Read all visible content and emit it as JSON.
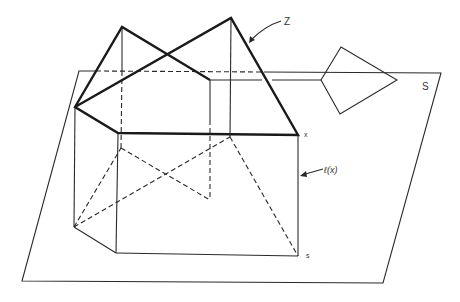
{
  "diagram": {
    "type": "geometric-3d-figure",
    "labels": {
      "Z": "Z",
      "S": "S",
      "x": "x",
      "s": "s",
      "ell": "ℓ(x)"
    },
    "elements": [
      {
        "id": "plane-S",
        "desc": "Parallelogram plane S, partially hidden behind figure"
      },
      {
        "id": "set-Z",
        "desc": "Bold polygonal set Z with two triangular peaks above box"
      },
      {
        "id": "prism-box",
        "desc": "Box/prism under Z with hidden dashed edges"
      },
      {
        "id": "kite",
        "desc": "Kite-shaped quadrilateral on the right, attached by horizontal line"
      },
      {
        "id": "fiber-l-x",
        "desc": "Vertical line ℓ(x) from point x down to point s"
      }
    ]
  }
}
